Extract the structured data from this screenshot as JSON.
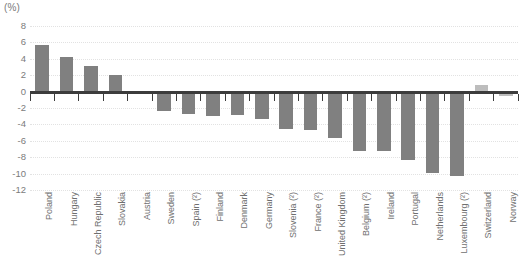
{
  "unit_label": "(%)",
  "colors": {
    "bar_primary": "#808080",
    "bar_secondary": "#bdbdbd",
    "axis": "#3c3c3c",
    "gridline": "#e2e2e2",
    "text": "#6f6f6f"
  },
  "chart_data": {
    "type": "bar",
    "title": "",
    "subtitle": "",
    "xlabel": "",
    "ylabel": "(%)",
    "ylim": [
      -12,
      8
    ],
    "ytick_step": 2,
    "yticks": [
      8,
      6,
      4,
      2,
      0,
      -2,
      -4,
      -6,
      -8,
      -10,
      -12
    ],
    "ytick_labels": [
      "8",
      "6",
      "4",
      "2",
      "0",
      "-2",
      "-4",
      "-6",
      "-8",
      "-10",
      "-12"
    ],
    "grid": true,
    "grid_axis": "y",
    "legend": false,
    "legend_position": "none",
    "categories": [
      "Poland",
      "Hungary",
      "Czech Republic",
      "Slovakia",
      "Austria",
      "Sweden",
      "Spain (²)",
      "Finland",
      "Denmark",
      "Germany",
      "Slovenia (²)",
      "France (²)",
      "United Kingdom",
      "Belgium (²)",
      "Ireland",
      "Portugal",
      "Netherlands",
      "Luxembourg (²)",
      "Switzerland",
      "Norway"
    ],
    "values": [
      5.7,
      4.2,
      3.1,
      2.0,
      0.0,
      -2.4,
      -2.7,
      -3.0,
      -2.9,
      -3.4,
      -4.6,
      -4.7,
      -5.7,
      -7.2,
      -7.3,
      -8.4,
      -9.9,
      -10.3,
      0.8,
      -0.5
    ],
    "bar_styles": [
      "primary",
      "primary",
      "primary",
      "primary",
      "primary",
      "primary",
      "primary",
      "primary",
      "primary",
      "primary",
      "primary",
      "primary",
      "primary",
      "primary",
      "primary",
      "primary",
      "primary",
      "primary",
      "secondary",
      "secondary"
    ]
  }
}
